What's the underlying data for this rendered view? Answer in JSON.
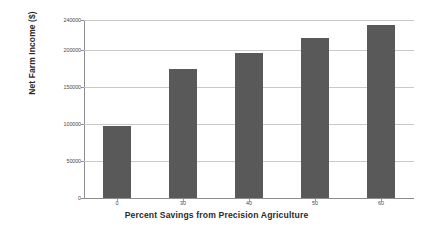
{
  "chart_data": {
    "type": "bar",
    "title": "",
    "xlabel": "Percent Savings from Precision Agriculture",
    "ylabel": "Net Farm Income ($)",
    "categories": [
      "0",
      "30",
      "40",
      "50",
      "60"
    ],
    "values": [
      97000,
      174000,
      196000,
      216000,
      233000
    ],
    "ylim": [
      0,
      240000
    ],
    "yticks": [
      0,
      50000,
      100000,
      150000,
      200000,
      240000
    ],
    "ytick_labels": [
      "0",
      "50000",
      "100000",
      "150000",
      "200000",
      "240000"
    ],
    "grid": "horizontal",
    "legend": "none",
    "bar_color": "#595959",
    "gridline_color": "#c9c9c9",
    "axis_color": "#8d8d8d",
    "text_color": "#2b2b2b"
  }
}
